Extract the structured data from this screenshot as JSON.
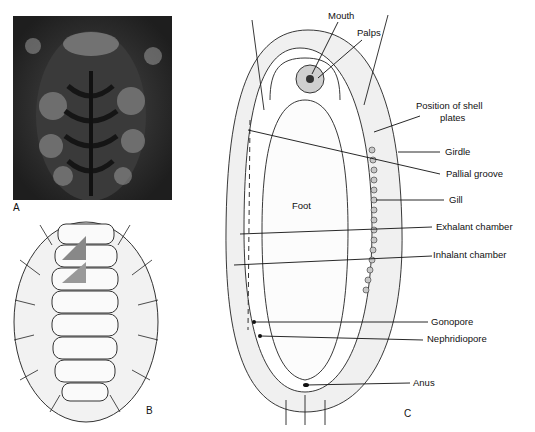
{
  "figure": {
    "panels": [
      {
        "id": "A",
        "letter": "A",
        "description": "Photograph of a chiton on rock"
      },
      {
        "id": "B",
        "letter": "B",
        "description": "Drawing of a bristly chiton dorsal view with eight shell plates"
      },
      {
        "id": "C",
        "letter": "C",
        "description": "Ventral view diagram of chiton anatomy"
      }
    ],
    "labels": {
      "mouth": "Mouth",
      "palps": "Palps",
      "shell_plates": "Position of shell",
      "shell_plates_2": "plates",
      "girdle": "Girdle",
      "pallial_groove": "Pallial groove",
      "gill": "Gill",
      "foot": "Foot",
      "exhalant": "Exhalant chamber",
      "inhalant": "Inhalant chamber",
      "gonopore": "Gonopore",
      "nephridiopore": "Nephridiopore",
      "anus": "Anus"
    }
  }
}
